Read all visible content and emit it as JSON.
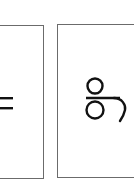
{
  "grid": {
    "cells": [
      {
        "char": "=",
        "name": "equals sign",
        "partially_visible": true
      },
      {
        "char": "ဌ",
        "name": "myanmar letter ttha",
        "partially_visible": true
      }
    ]
  },
  "colors": {
    "border": "#6b6b6b",
    "glyph": "#111111",
    "background": "#ffffff"
  }
}
